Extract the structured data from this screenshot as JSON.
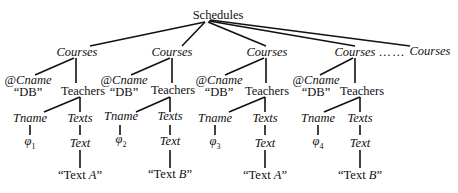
{
  "root": {
    "label": "Schedules"
  },
  "ellipsis": "……",
  "courses": [
    {
      "label": "Courses",
      "attr": "@Cname",
      "attr_value": "“DB”",
      "teachers": "Teachers",
      "tname": "Tname",
      "phi": "φ",
      "phi_index": "1",
      "texts": "Texts",
      "text": "Text",
      "text_value_prefix": "“Text ",
      "text_value_var": "A",
      "text_value_suffix": "”"
    },
    {
      "label": "Courses",
      "attr": "@Cname",
      "attr_value": "“DB”",
      "teachers": "Teachers",
      "tname": "Tname",
      "phi": "φ",
      "phi_index": "2",
      "texts": "Texts",
      "text": "Text",
      "text_value_prefix": "“Text ",
      "text_value_var": "B",
      "text_value_suffix": "”"
    },
    {
      "label": "Courses",
      "attr": "@Cname",
      "attr_value": "“DB”",
      "teachers": "Teachers",
      "tname": "Tname",
      "phi": "φ",
      "phi_index": "3",
      "texts": "Texts",
      "text": "Text",
      "text_value_prefix": "“Text ",
      "text_value_var": "A",
      "text_value_suffix": "”"
    },
    {
      "label": "Courses",
      "attr": "@Cname",
      "attr_value": "“DB”",
      "teachers": "Teachers",
      "tname": "Tname",
      "phi": "φ",
      "phi_index": "4",
      "texts": "Texts",
      "text": "Text",
      "text_value_prefix": "“Text ",
      "text_value_var": "B",
      "text_value_suffix": "”"
    }
  ],
  "last_course": {
    "label": "Courses"
  }
}
